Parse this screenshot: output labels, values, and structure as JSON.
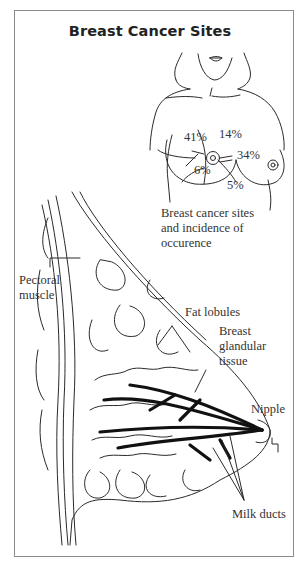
{
  "title": "Breast Cancer Sites",
  "torso_diagram": {
    "percentages": [
      {
        "region": "upper-outer",
        "value": "41%"
      },
      {
        "region": "upper-inner",
        "value": "14%"
      },
      {
        "region": "central",
        "value": "34%"
      },
      {
        "region": "lower-outer",
        "value": "6%"
      },
      {
        "region": "lower-inner",
        "value": "5%"
      }
    ],
    "caption_lines": [
      "Breast cancer sites",
      "and incidence of",
      "occurence"
    ]
  },
  "anatomy_diagram": {
    "labels": {
      "pectoral_muscle": [
        "Pectoral",
        "muscle"
      ],
      "fat_lobules": "Fat lobules",
      "glandular_tissue": [
        "Breast",
        "glandular",
        "tissue"
      ],
      "nipple": "Nipple",
      "milk_ducts": "Milk ducts"
    }
  },
  "colors": {
    "line": "#2a2a2a",
    "frame": "#8a8a8a",
    "background": "#ffffff"
  }
}
